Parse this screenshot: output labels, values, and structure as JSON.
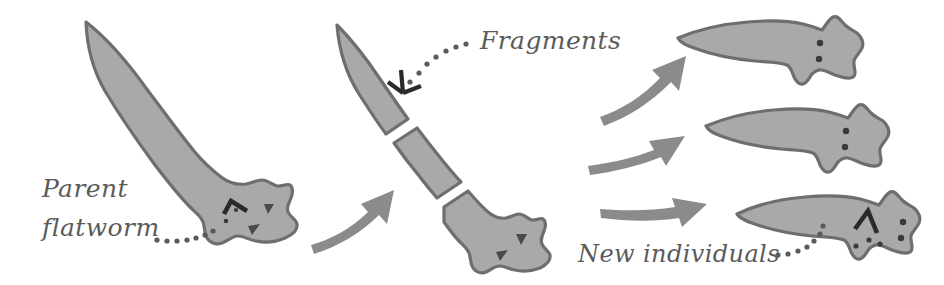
{
  "diagram": {
    "background_color": "#ffffff",
    "body_fill_color": "#a9a9a9",
    "body_outline_color": "#6e6e6e",
    "tail_dark_color": "#5f5f5f",
    "arrow_color": "#8b8b8b",
    "label_color": "#5b5b5b",
    "mark_color": "#2a2a2a"
  },
  "labels": {
    "parent": {
      "line1": "Parent",
      "line2": "flatworm"
    },
    "fragments": "Fragments",
    "new_individuals": "New individuals"
  },
  "stages": [
    {
      "id": "parent",
      "name": "Parent flatworm",
      "organisms": 1,
      "description": "Intact parent flatworm with head markings and two eyespots"
    },
    {
      "id": "fragments",
      "name": "Fragments",
      "organisms": 3,
      "description": "Parent body separated into three fragments: tail piece, middle piece, head piece"
    },
    {
      "id": "new-individuals",
      "name": "New individuals",
      "organisms": 3,
      "description": "Each fragment regenerates into a complete new flatworm"
    }
  ],
  "arrows": [
    {
      "id": "arrow-parent-to-fragments",
      "from": "parent",
      "to": "fragments"
    },
    {
      "id": "arrow-fragments-to-individual-1",
      "from": "fragments",
      "to": "new-individual-1"
    },
    {
      "id": "arrow-fragments-to-individual-2",
      "from": "fragments",
      "to": "new-individual-2"
    },
    {
      "id": "arrow-fragments-to-individual-3",
      "from": "fragments",
      "to": "new-individual-3"
    }
  ]
}
